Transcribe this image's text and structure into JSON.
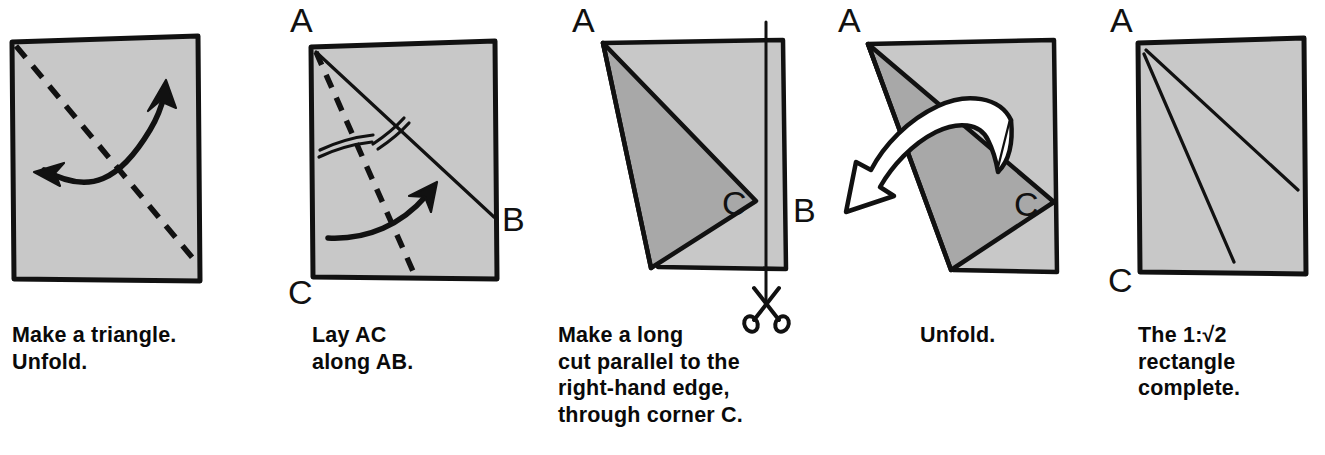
{
  "figure": {
    "background_color": "#ffffff",
    "paper_fill": "#c8c8c8",
    "paper_fill_dark": "#a8a8a8",
    "ink_color": "#111111",
    "arrow_fill": "#ffffff",
    "panel_count": 5
  },
  "panels": [
    {
      "id": "panel-1",
      "step_number": 1,
      "caption_lines": [
        "Make a triangle.",
        "Unfold."
      ],
      "caption": "Make a triangle.\nUnfold.",
      "labels": [],
      "annotations": {
        "crease_type": "dashed-diagonal",
        "arrow_type": "double-headed-curved-arrow",
        "arrow_meaning": "fold and unfold"
      }
    },
    {
      "id": "panel-2",
      "step_number": 2,
      "caption_lines": [
        "Lay AC",
        "along AB."
      ],
      "caption": "Lay AC\nalong AB.",
      "labels": [
        {
          "text": "A",
          "corner": "top-left"
        },
        {
          "text": "B",
          "corner": "right-edge"
        },
        {
          "text": "C",
          "corner": "bottom-left"
        }
      ],
      "annotations": {
        "crease_type": "dashed-angle-bisector",
        "solid_line": "diagonal A to B",
        "tick_marks": "two equal-angle double arcs",
        "arrow_type": "curved-arrow",
        "arrow_meaning": "fold"
      }
    },
    {
      "id": "panel-3",
      "step_number": 3,
      "caption_lines": [
        "Make a long",
        "cut parallel to the",
        "right-hand edge,",
        "through corner C."
      ],
      "caption": "Make a long\ncut parallel to the\nright-hand edge,\nthrough corner C.",
      "labels": [
        {
          "text": "A",
          "corner": "top-left"
        },
        {
          "text": "C",
          "corner": "interior-right"
        },
        {
          "text": "B",
          "corner": "right-edge"
        }
      ],
      "annotations": {
        "cut_line": "vertical line through corner C",
        "icon": "scissors-icon",
        "flap": "folded flap shown darker"
      }
    },
    {
      "id": "panel-4",
      "step_number": 4,
      "caption_lines": [
        "Unfold."
      ],
      "caption": "Unfold.",
      "labels": [
        {
          "text": "A",
          "corner": "top-left"
        },
        {
          "text": "C",
          "corner": "interior-right"
        }
      ],
      "annotations": {
        "arrow_type": "white-hollow-curved-arrow",
        "arrow_meaning": "unfold"
      }
    },
    {
      "id": "panel-5",
      "step_number": 5,
      "caption_lines": [
        "The 1:√2",
        "rectangle",
        "complete."
      ],
      "caption": "The 1:√2\nrectangle\ncomplete.",
      "caption_prefix": "The ",
      "caption_ratio": "1:√2",
      "caption_rest_lines": [
        "rectangle",
        "complete."
      ],
      "labels": [
        {
          "text": "A",
          "corner": "top-left"
        },
        {
          "text": "C",
          "corner": "bottom-left"
        }
      ],
      "annotations": {
        "crease_lines": "two crease lines from corner A"
      }
    }
  ],
  "icons": {
    "scissors": "scissors-icon"
  }
}
